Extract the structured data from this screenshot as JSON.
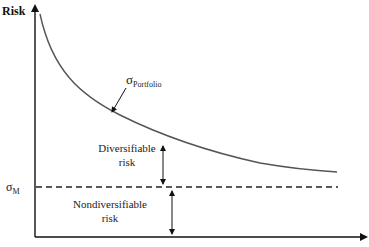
{
  "diagram": {
    "y_axis_label": "Risk",
    "x_axis_label": "",
    "curve_label": {
      "symbol": "σ",
      "subscript": "Portfolio"
    },
    "market_level_label": {
      "symbol": "σ",
      "subscript": "M"
    },
    "diversifiable_label": {
      "line1": "Diversifiable",
      "line2": "risk"
    },
    "nondiversifiable_label": {
      "line1": "Nondiversifiable",
      "line2": "risk"
    },
    "colors": {
      "axis": "#111111",
      "curve": "#555555",
      "dashed": "#222222",
      "text": "#222222"
    }
  }
}
